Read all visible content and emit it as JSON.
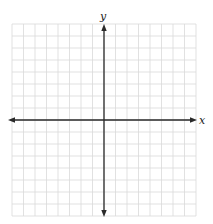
{
  "diagram": {
    "type": "coordinate-plane",
    "x_axis_label": "x",
    "y_axis_label": "y",
    "grid": {
      "columns_left": 8,
      "columns_right": 8,
      "rows_above": 8,
      "rows_below": 8,
      "line_color": "#d9d9d9",
      "axis_color": "#2a2a2a"
    },
    "arrows": {
      "x_axis": "both-ends",
      "y_axis": "both-ends"
    }
  }
}
